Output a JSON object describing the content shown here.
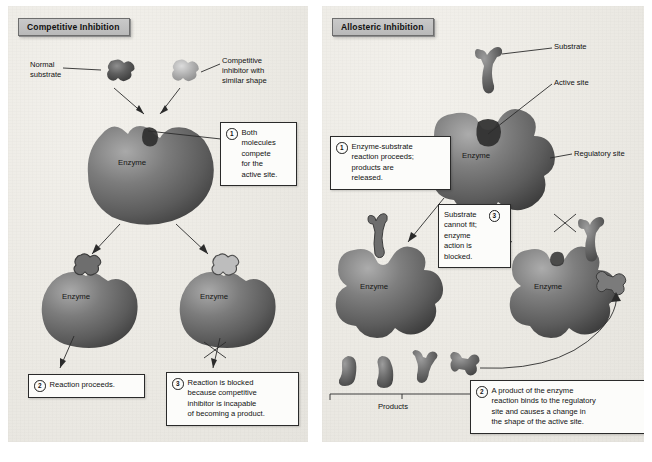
{
  "figure": {
    "background_color": "#ffffff",
    "panel_color": "#ecead4"
  },
  "panels": [
    {
      "id": "competitive",
      "banner": "Competitive Inhibition",
      "labels": [
        {
          "name": "normal-substrate",
          "text": "Normal\nsubstrate"
        },
        {
          "name": "competitive-inhibitor",
          "text": "Competitive\ninhibitor with\nsimilar shape"
        },
        {
          "name": "enzyme-top",
          "text": "Enzyme"
        },
        {
          "name": "enzyme-left",
          "text": "Enzyme"
        },
        {
          "name": "enzyme-right",
          "text": "Enzyme"
        }
      ],
      "callouts": [
        {
          "num": "1",
          "text": "Both\nmolecules\ncompete\nfor the\nactive site."
        },
        {
          "num": "2",
          "text": "Reaction proceeds."
        },
        {
          "num": "3",
          "text": "Reaction is blocked\nbecause competitive\ninhibitor is incapable\nof becoming a product."
        }
      ]
    },
    {
      "id": "allosteric",
      "banner": "Allosteric Inhibition",
      "labels": [
        {
          "name": "substrate",
          "text": "Substrate"
        },
        {
          "name": "active-site",
          "text": "Active site"
        },
        {
          "name": "regulatory-site",
          "text": "Regulatory site"
        },
        {
          "name": "enzyme-top",
          "text": "Enzyme"
        },
        {
          "name": "enzyme-left",
          "text": "Enzyme"
        },
        {
          "name": "enzyme-right",
          "text": "Enzyme"
        },
        {
          "name": "products",
          "text": "Products"
        }
      ],
      "callouts": [
        {
          "num": "1",
          "text": "Enzyme-substrate\nreaction proceeds;\nproducts are\nreleased."
        },
        {
          "num": "3",
          "text": "Substrate\ncannot fit;\nenzyme\naction is\nblocked."
        },
        {
          "num": "2",
          "text": "A product of the enzyme\nreaction binds to the regulatory\nsite and causes a change in\nthe shape of the active site."
        }
      ]
    }
  ],
  "icons": {
    "blocked": "x-cross-icon",
    "arrow": "arrow-icon",
    "bracket": "bracket-icon"
  }
}
